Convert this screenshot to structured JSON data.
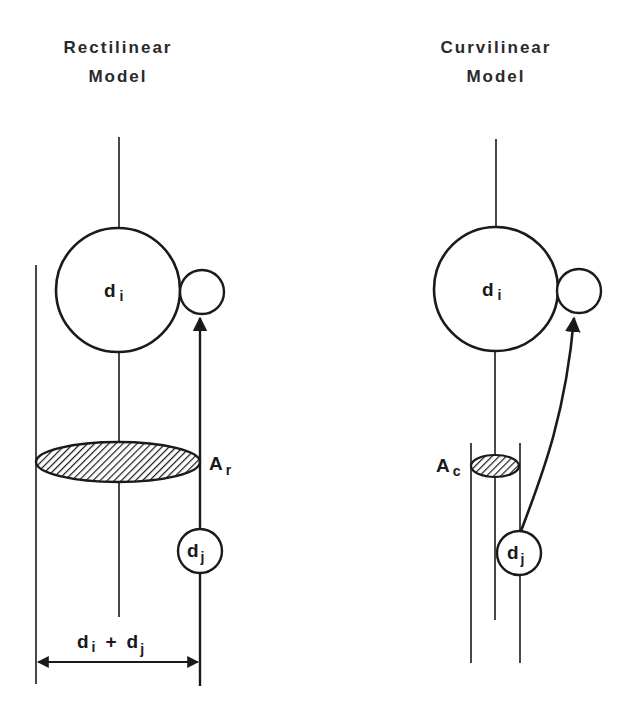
{
  "panels": {
    "left": {
      "title_line1": "Rectilinear",
      "title_line2": "Model",
      "large_circle_label": "d",
      "large_circle_sub": "i",
      "small_moving_label": "d",
      "small_moving_sub": "j",
      "area_label": "A",
      "area_sub": "r",
      "dimension_label_d1": "d",
      "dimension_sub1": "i",
      "dimension_plus": "+",
      "dimension_label_d2": "d",
      "dimension_sub2": "j"
    },
    "right": {
      "title_line1": "Curvilinear",
      "title_line2": "Model",
      "large_circle_label": "d",
      "large_circle_sub": "i",
      "small_moving_label": "d",
      "small_moving_sub": "j",
      "area_label": "A",
      "area_sub": "c"
    }
  },
  "colors": {
    "stroke": "#1a1a1a",
    "background": "#ffffff"
  }
}
